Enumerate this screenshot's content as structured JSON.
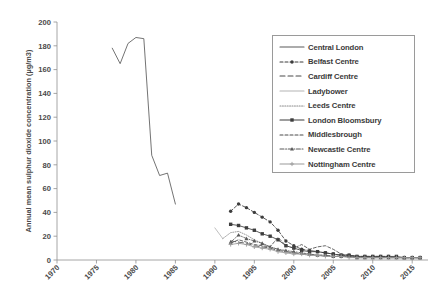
{
  "chart_data": {
    "type": "line",
    "title": "",
    "xlabel": "",
    "ylabel": "Annual mean sulphur dioxide concentration (µg/m3)",
    "xlim": [
      1970,
      2017
    ],
    "ylim": [
      0,
      200
    ],
    "xticks": [
      1970,
      1975,
      1980,
      1985,
      1990,
      1995,
      2000,
      2005,
      2010,
      2015
    ],
    "yticks": [
      0,
      20,
      40,
      60,
      80,
      100,
      120,
      140,
      160,
      180,
      200
    ],
    "grid": false,
    "legend_position": "upper-right",
    "xtick_rotation": -45,
    "series": [
      {
        "name": "Central London",
        "color": "#5a5a5a",
        "style": "solid",
        "marker": "none",
        "points": [
          [
            1977,
            178
          ],
          [
            1978,
            165
          ],
          [
            1979,
            182
          ],
          [
            1980,
            187
          ],
          [
            1981,
            186
          ],
          [
            1982,
            88
          ],
          [
            1983,
            71
          ],
          [
            1984,
            73
          ],
          [
            1985,
            47
          ]
        ]
      },
      {
        "name": "Belfast Centre",
        "color": "#3d3d3d",
        "style": "dashed",
        "marker": "dot",
        "points": [
          [
            1992,
            41
          ],
          [
            1993,
            47
          ],
          [
            1994,
            44
          ],
          [
            1995,
            40
          ],
          [
            1996,
            36
          ],
          [
            1997,
            32
          ],
          [
            1998,
            25
          ],
          [
            1999,
            16
          ],
          [
            2000,
            12
          ],
          [
            2001,
            9
          ],
          [
            2002,
            8
          ],
          [
            2003,
            7
          ],
          [
            2004,
            6
          ],
          [
            2005,
            5
          ],
          [
            2006,
            4
          ],
          [
            2007,
            4
          ],
          [
            2008,
            3
          ],
          [
            2009,
            3
          ],
          [
            2010,
            3
          ],
          [
            2011,
            3
          ],
          [
            2012,
            3
          ],
          [
            2013,
            2
          ],
          [
            2014,
            2
          ],
          [
            2015,
            2
          ],
          [
            2016,
            2
          ]
        ]
      },
      {
        "name": "Cardiff Centre",
        "color": "#4a4a4a",
        "style": "long-dash",
        "marker": "none",
        "points": [
          [
            1992,
            16
          ],
          [
            1993,
            15
          ],
          [
            1994,
            14
          ],
          [
            1995,
            12
          ],
          [
            1996,
            11
          ],
          [
            1997,
            10
          ],
          [
            1998,
            8
          ],
          [
            1999,
            7
          ],
          [
            2000,
            6
          ],
          [
            2001,
            5
          ],
          [
            2002,
            5
          ],
          [
            2003,
            4
          ],
          [
            2004,
            4
          ],
          [
            2005,
            3
          ],
          [
            2006,
            3
          ],
          [
            2007,
            3
          ],
          [
            2008,
            2
          ],
          [
            2009,
            2
          ],
          [
            2010,
            2
          ],
          [
            2011,
            2
          ],
          [
            2012,
            2
          ],
          [
            2013,
            2
          ],
          [
            2014,
            2
          ],
          [
            2015,
            2
          ],
          [
            2016,
            2
          ]
        ]
      },
      {
        "name": "Ladybower",
        "color": "#b4b4b4",
        "style": "solid",
        "marker": "none",
        "points": [
          [
            1990,
            27
          ],
          [
            1991,
            18
          ]
        ]
      },
      {
        "name": "Leeds Centre",
        "color": "#8c8c8c",
        "style": "dotted",
        "marker": "none",
        "points": [
          [
            1991,
            18
          ],
          [
            1992,
            23
          ],
          [
            1993,
            24
          ],
          [
            1994,
            21
          ],
          [
            1995,
            17
          ],
          [
            1996,
            14
          ],
          [
            1997,
            11
          ],
          [
            1998,
            9
          ],
          [
            1999,
            7
          ],
          [
            2000,
            6
          ],
          [
            2001,
            5
          ],
          [
            2002,
            4
          ],
          [
            2003,
            4
          ],
          [
            2004,
            3
          ],
          [
            2005,
            3
          ],
          [
            2006,
            3
          ],
          [
            2007,
            3
          ],
          [
            2008,
            2
          ],
          [
            2009,
            2
          ],
          [
            2010,
            2
          ],
          [
            2011,
            2
          ],
          [
            2012,
            2
          ],
          [
            2013,
            2
          ],
          [
            2014,
            2
          ],
          [
            2015,
            2
          ],
          [
            2016,
            2
          ]
        ]
      },
      {
        "name": "London Bloomsbury",
        "color": "#3d3d3d",
        "style": "solid",
        "marker": "square",
        "points": [
          [
            1992,
            30
          ],
          [
            1993,
            29
          ],
          [
            1994,
            27
          ],
          [
            1995,
            25
          ],
          [
            1996,
            22
          ],
          [
            1997,
            20
          ],
          [
            1998,
            17
          ],
          [
            1999,
            12
          ],
          [
            2000,
            10
          ],
          [
            2001,
            8
          ],
          [
            2002,
            7
          ],
          [
            2003,
            7
          ],
          [
            2004,
            6
          ],
          [
            2005,
            5
          ],
          [
            2006,
            4
          ],
          [
            2007,
            4
          ],
          [
            2008,
            3
          ],
          [
            2009,
            3
          ],
          [
            2010,
            3
          ],
          [
            2011,
            3
          ],
          [
            2012,
            3
          ],
          [
            2013,
            3
          ],
          [
            2014,
            2
          ],
          [
            2015,
            2
          ],
          [
            2016,
            2
          ]
        ]
      },
      {
        "name": "Middlesbrough",
        "color": "#4a4a4a",
        "style": "dashed",
        "marker": "none",
        "points": [
          [
            1992,
            14
          ],
          [
            1993,
            17
          ],
          [
            1994,
            15
          ],
          [
            1995,
            13
          ],
          [
            1996,
            12
          ],
          [
            1997,
            11
          ],
          [
            1998,
            19
          ],
          [
            1999,
            12
          ],
          [
            2000,
            10
          ],
          [
            2001,
            13
          ],
          [
            2002,
            9
          ],
          [
            2003,
            11
          ],
          [
            2004,
            12
          ],
          [
            2005,
            9
          ],
          [
            2006,
            5
          ],
          [
            2007,
            4
          ],
          [
            2008,
            3
          ],
          [
            2009,
            3
          ],
          [
            2010,
            3
          ],
          [
            2011,
            3
          ],
          [
            2012,
            2
          ],
          [
            2013,
            2
          ],
          [
            2014,
            2
          ],
          [
            2015,
            2
          ],
          [
            2016,
            2
          ]
        ]
      },
      {
        "name": "Newcastle Centre",
        "color": "#5a5a5a",
        "style": "dash-dot",
        "marker": "triangle",
        "points": [
          [
            1992,
            15
          ],
          [
            1993,
            21
          ],
          [
            1994,
            18
          ],
          [
            1995,
            16
          ],
          [
            1996,
            14
          ],
          [
            1997,
            11
          ],
          [
            1998,
            9
          ],
          [
            1999,
            8
          ],
          [
            2000,
            7
          ],
          [
            2001,
            6
          ],
          [
            2002,
            5
          ],
          [
            2003,
            4
          ],
          [
            2004,
            4
          ],
          [
            2005,
            3
          ],
          [
            2006,
            3
          ],
          [
            2007,
            3
          ],
          [
            2008,
            2
          ],
          [
            2009,
            2
          ],
          [
            2010,
            2
          ],
          [
            2011,
            2
          ],
          [
            2012,
            2
          ],
          [
            2013,
            2
          ],
          [
            2014,
            2
          ],
          [
            2015,
            2
          ],
          [
            2016,
            2
          ]
        ]
      },
      {
        "name": "Nottingham Centre",
        "color": "#9a9a9a",
        "style": "solid-plus",
        "marker": "plus",
        "points": [
          [
            1992,
            13
          ],
          [
            1993,
            14
          ],
          [
            1994,
            13
          ],
          [
            1995,
            11
          ],
          [
            1996,
            10
          ],
          [
            1997,
            9
          ],
          [
            1998,
            7
          ],
          [
            1999,
            6
          ],
          [
            2000,
            5
          ],
          [
            2001,
            5
          ],
          [
            2002,
            4
          ],
          [
            2003,
            4
          ],
          [
            2004,
            3
          ],
          [
            2005,
            3
          ],
          [
            2006,
            3
          ],
          [
            2007,
            2
          ],
          [
            2008,
            2
          ],
          [
            2009,
            2
          ],
          [
            2010,
            2
          ],
          [
            2011,
            2
          ],
          [
            2012,
            2
          ],
          [
            2013,
            2
          ],
          [
            2014,
            2
          ],
          [
            2015,
            2
          ],
          [
            2016,
            2
          ]
        ]
      }
    ]
  },
  "legend": {
    "items": [
      {
        "label": "Central London"
      },
      {
        "label": "Belfast Centre"
      },
      {
        "label": "Cardiff Centre"
      },
      {
        "label": "Ladybower"
      },
      {
        "label": "Leeds Centre"
      },
      {
        "label": "London Bloomsbury"
      },
      {
        "label": "Middlesbrough"
      },
      {
        "label": "Newcastle Centre"
      },
      {
        "label": "Nottingham Centre"
      }
    ]
  }
}
